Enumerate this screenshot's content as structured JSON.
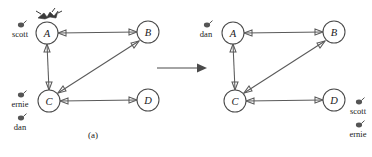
{
  "figure": {
    "panels": [
      {
        "id": "a",
        "caption": "(a)",
        "nodes": [
          {
            "id": "A",
            "label": "A",
            "cx": 47,
            "cy": 33,
            "r": 11
          },
          {
            "id": "B",
            "label": "B",
            "cx": 148,
            "cy": 32,
            "r": 11
          },
          {
            "id": "C",
            "label": "C",
            "cx": 49,
            "cy": 101,
            "r": 11
          },
          {
            "id": "D",
            "label": "D",
            "cx": 148,
            "cy": 100,
            "r": 11
          }
        ],
        "edges": [
          {
            "from": "A",
            "to": "B",
            "kind": "bidirectional"
          },
          {
            "from": "A",
            "to": "C",
            "kind": "bidirectional"
          },
          {
            "from": "C",
            "to": "B",
            "kind": "bidirectional"
          },
          {
            "from": "C",
            "to": "D",
            "kind": "bidirectional"
          }
        ],
        "tokens": [
          {
            "name": "scott",
            "at_node": "A",
            "x": 20,
            "y": 27
          },
          {
            "name": "ernie",
            "at_node": "C",
            "x": 20,
            "y": 97
          },
          {
            "name": "dan",
            "at_node": "C",
            "x": 20,
            "y": 120
          }
        ],
        "marker": {
          "node": "A",
          "icon": "crown-icon"
        }
      },
      {
        "id": "b",
        "caption": "(b)",
        "nodes": [
          {
            "id": "A",
            "label": "A",
            "cx": 47,
            "cy": 33,
            "r": 11
          },
          {
            "id": "B",
            "label": "B",
            "cx": 148,
            "cy": 32,
            "r": 11
          },
          {
            "id": "C",
            "label": "C",
            "cx": 49,
            "cy": 101,
            "r": 11
          },
          {
            "id": "D",
            "label": "D",
            "cx": 148,
            "cy": 100,
            "r": 11
          }
        ],
        "edges": [
          {
            "from": "A",
            "to": "B",
            "kind": "bidirectional"
          },
          {
            "from": "A",
            "to": "C",
            "kind": "bidirectional"
          },
          {
            "from": "C",
            "to": "B",
            "kind": "bidirectional"
          },
          {
            "from": "C",
            "to": "D",
            "kind": "bidirectional"
          }
        ],
        "tokens": [
          {
            "name": "dan",
            "at_node": "A",
            "x": 20,
            "y": 27
          },
          {
            "name": "scott",
            "at_node": "D",
            "x": 172,
            "y": 104
          },
          {
            "name": "ernie",
            "at_node": "D",
            "x": 172,
            "y": 127
          }
        ],
        "marker": null
      }
    ],
    "transition": {
      "icon": "right-arrow-icon"
    }
  },
  "colors": {
    "node_stroke": "#4a4a4a",
    "edge_stroke": "#5a5a5a",
    "token_fill": "#555555",
    "text": "#1a1a1a",
    "background": "#ffffff"
  }
}
